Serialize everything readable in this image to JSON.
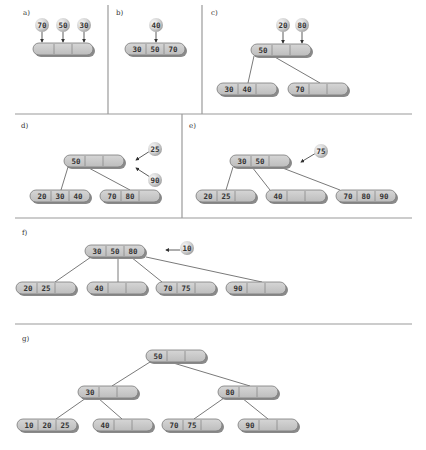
{
  "figure": {
    "colors": {
      "node_fill": "#c9c9c9",
      "node_shadow": "#8a8a8a",
      "node_stroke": "#7a7a7a",
      "cell_divider": "#888888",
      "ball_light": "#f4f4f4",
      "ball_dark": "#a8a8a8",
      "divider_line": "#9a9a9a",
      "edge_line": "#7a7a7a"
    },
    "dividers": [
      {
        "x1": 108,
        "y1": 5,
        "x2": 108,
        "y2": 114
      },
      {
        "x1": 202,
        "y1": 5,
        "x2": 202,
        "y2": 114
      },
      {
        "x1": 15,
        "y1": 114,
        "x2": 412,
        "y2": 114
      },
      {
        "x1": 182,
        "y1": 114,
        "x2": 182,
        "y2": 218
      },
      {
        "x1": 15,
        "y1": 218,
        "x2": 412,
        "y2": 218
      },
      {
        "x1": 15,
        "y1": 324,
        "x2": 412,
        "y2": 324
      }
    ],
    "panels": [
      {
        "id": "a",
        "label": "a)",
        "label_x": 23,
        "label_y": 15,
        "nodes": [
          {
            "id": "a-root",
            "x": 33,
            "y": 43,
            "keys": [
              "",
              "",
              ""
            ]
          }
        ],
        "edges": [],
        "incoming": [
          {
            "value": "70",
            "bx": 42,
            "by": 25,
            "ax1": 42,
            "ay1": 32,
            "ax2": 42,
            "ay2": 42
          },
          {
            "value": "50",
            "bx": 63,
            "by": 25,
            "ax1": 63,
            "ay1": 32,
            "ax2": 63,
            "ay2": 42
          },
          {
            "value": "30",
            "bx": 84,
            "by": 25,
            "ax1": 84,
            "ay1": 32,
            "ax2": 84,
            "ay2": 42
          }
        ]
      },
      {
        "id": "b",
        "label": "b)",
        "label_x": 116,
        "label_y": 15,
        "nodes": [
          {
            "id": "b-root",
            "x": 125,
            "y": 43,
            "keys": [
              "30",
              "50",
              "70"
            ]
          }
        ],
        "edges": [],
        "incoming": [
          {
            "value": "40",
            "bx": 156,
            "by": 25,
            "ax1": 156,
            "ay1": 32,
            "ax2": 156,
            "ay2": 42
          }
        ]
      },
      {
        "id": "c",
        "label": "c)",
        "label_x": 211,
        "label_y": 15,
        "nodes": [
          {
            "id": "c-root",
            "x": 251,
            "y": 44,
            "keys": [
              "50",
              "",
              ""
            ]
          },
          {
            "id": "c-left",
            "x": 217,
            "y": 83,
            "keys": [
              "30",
              "40",
              ""
            ]
          },
          {
            "id": "c-right",
            "x": 288,
            "y": 83,
            "keys": [
              "70",
              "",
              ""
            ]
          }
        ],
        "edges": [
          {
            "x1": 254,
            "y1": 56,
            "x2": 248,
            "y2": 83
          },
          {
            "x1": 273,
            "y1": 56,
            "x2": 320,
            "y2": 83
          }
        ],
        "incoming": [
          {
            "value": "20",
            "bx": 283,
            "by": 25,
            "ax1": 283,
            "ay1": 32,
            "ax2": 283,
            "ay2": 43
          },
          {
            "value": "80",
            "bx": 302,
            "by": 25,
            "ax1": 302,
            "ay1": 32,
            "ax2": 302,
            "ay2": 43
          }
        ]
      },
      {
        "id": "d",
        "label": "d)",
        "label_x": 21,
        "label_y": 128,
        "nodes": [
          {
            "id": "d-root",
            "x": 64,
            "y": 155,
            "keys": [
              "50",
              "",
              ""
            ]
          },
          {
            "id": "d-left",
            "x": 30,
            "y": 190,
            "keys": [
              "20",
              "30",
              "40"
            ]
          },
          {
            "id": "d-right",
            "x": 100,
            "y": 190,
            "keys": [
              "70",
              "80",
              ""
            ]
          }
        ],
        "edges": [
          {
            "x1": 68,
            "y1": 167,
            "x2": 61,
            "y2": 190
          },
          {
            "x1": 87,
            "y1": 167,
            "x2": 130,
            "y2": 190
          }
        ],
        "incoming": [
          {
            "value": "25",
            "bx": 155,
            "by": 149,
            "ax1": 150,
            "ay1": 151,
            "ax2": 136,
            "ay2": 160
          },
          {
            "value": "90",
            "bx": 155,
            "by": 180,
            "ax1": 150,
            "ay1": 177,
            "ax2": 136,
            "ay2": 168
          }
        ]
      },
      {
        "id": "e",
        "label": "e)",
        "label_x": 189,
        "label_y": 128,
        "nodes": [
          {
            "id": "e-root",
            "x": 230,
            "y": 155,
            "keys": [
              "30",
              "50",
              ""
            ]
          },
          {
            "id": "e-left",
            "x": 196,
            "y": 190,
            "keys": [
              "20",
              "25",
              ""
            ]
          },
          {
            "id": "e-mid",
            "x": 266,
            "y": 190,
            "keys": [
              "40",
              "",
              ""
            ]
          },
          {
            "id": "e-right",
            "x": 336,
            "y": 190,
            "keys": [
              "70",
              "80",
              "90"
            ]
          }
        ],
        "edges": [
          {
            "x1": 233,
            "y1": 167,
            "x2": 226,
            "y2": 190
          },
          {
            "x1": 252,
            "y1": 167,
            "x2": 270,
            "y2": 190
          },
          {
            "x1": 280,
            "y1": 167,
            "x2": 340,
            "y2": 190
          }
        ],
        "incoming": [
          {
            "value": "75",
            "bx": 321,
            "by": 151,
            "ax1": 316,
            "ay1": 153,
            "ax2": 301,
            "ay2": 162
          }
        ]
      },
      {
        "id": "f",
        "label": "f)",
        "label_x": 22,
        "label_y": 235,
        "nodes": [
          {
            "id": "f-root",
            "x": 85,
            "y": 245,
            "keys": [
              "30",
              "50",
              "80"
            ]
          },
          {
            "id": "f-c1",
            "x": 16,
            "y": 282,
            "keys": [
              "20",
              "25",
              ""
            ]
          },
          {
            "id": "f-c2",
            "x": 87,
            "y": 282,
            "keys": [
              "40",
              "",
              ""
            ]
          },
          {
            "id": "f-c3",
            "x": 156,
            "y": 282,
            "keys": [
              "70",
              "75",
              ""
            ]
          },
          {
            "id": "f-c4",
            "x": 226,
            "y": 282,
            "keys": [
              "90",
              "",
              ""
            ]
          }
        ],
        "edges": [
          {
            "x1": 91,
            "y1": 257,
            "x2": 55,
            "y2": 282
          },
          {
            "x1": 118,
            "y1": 257,
            "x2": 118,
            "y2": 282
          },
          {
            "x1": 131,
            "y1": 257,
            "x2": 162,
            "y2": 282
          },
          {
            "x1": 146,
            "y1": 257,
            "x2": 262,
            "y2": 282
          }
        ],
        "incoming": [
          {
            "value": "10",
            "bx": 187,
            "by": 248,
            "ax1": 180,
            "ay1": 250,
            "ax2": 166,
            "ay2": 250
          }
        ]
      },
      {
        "id": "g",
        "label": "g)",
        "label_x": 22,
        "label_y": 341,
        "nodes": [
          {
            "id": "g-root",
            "x": 146,
            "y": 350,
            "keys": [
              "50",
              "",
              ""
            ]
          },
          {
            "id": "g-l",
            "x": 78,
            "y": 386,
            "keys": [
              "30",
              "",
              ""
            ]
          },
          {
            "id": "g-r",
            "x": 218,
            "y": 386,
            "keys": [
              "80",
              "",
              ""
            ]
          },
          {
            "id": "g-ll",
            "x": 17,
            "y": 419,
            "keys": [
              "10",
              "20",
              "25"
            ]
          },
          {
            "id": "g-lm",
            "x": 93,
            "y": 419,
            "keys": [
              "40",
              "",
              ""
            ]
          },
          {
            "id": "g-rl",
            "x": 162,
            "y": 419,
            "keys": [
              "70",
              "75",
              ""
            ]
          },
          {
            "id": "g-rm",
            "x": 238,
            "y": 419,
            "keys": [
              "90",
              "",
              ""
            ]
          }
        ],
        "edges": [
          {
            "x1": 150,
            "y1": 362,
            "x2": 112,
            "y2": 386
          },
          {
            "x1": 170,
            "y1": 362,
            "x2": 250,
            "y2": 386
          },
          {
            "x1": 86,
            "y1": 398,
            "x2": 56,
            "y2": 419
          },
          {
            "x1": 98,
            "y1": 398,
            "x2": 122,
            "y2": 419
          },
          {
            "x1": 224,
            "y1": 398,
            "x2": 194,
            "y2": 419
          },
          {
            "x1": 242,
            "y1": 398,
            "x2": 268,
            "y2": 419
          }
        ]
      }
    ]
  }
}
